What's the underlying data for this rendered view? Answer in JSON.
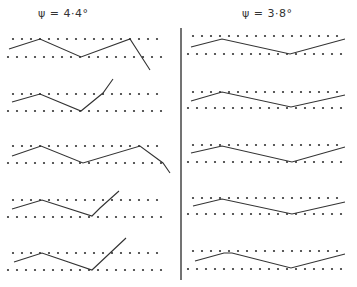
{
  "panels": [
    {
      "title": "ψ = 4·4°",
      "title_x": 60,
      "dot_x_start": 10,
      "dot_x_end": 162,
      "dot_spacing": 9,
      "rows": [
        {
          "top": 39,
          "bottom": 57,
          "points": [
            [
              9,
              49
            ],
            [
              40,
              39
            ],
            [
              81,
              57
            ],
            [
              130,
              39
            ],
            [
              150,
              70
            ]
          ]
        },
        {
          "top": 94,
          "bottom": 111,
          "points": [
            [
              12,
              102
            ],
            [
              40,
              94
            ],
            [
              81,
              111
            ],
            [
              103,
              93
            ],
            [
              113,
              79
            ]
          ]
        },
        {
          "top": 146,
          "bottom": 163,
          "points": [
            [
              12,
              156
            ],
            [
              41,
              146
            ],
            [
              83,
              163
            ],
            [
              140,
              146
            ],
            [
              163,
              163
            ],
            [
              170,
              173
            ]
          ]
        },
        {
          "top": 200,
          "bottom": 217,
          "points": [
            [
              12,
              209
            ],
            [
              42,
              200
            ],
            [
              92,
              216
            ],
            [
              100,
              208
            ],
            [
              119,
              191
            ]
          ]
        },
        {
          "top": 253,
          "bottom": 270,
          "points": [
            [
              14,
              262
            ],
            [
              42,
              253
            ],
            [
              92,
              270
            ],
            [
              126,
              238
            ]
          ]
        }
      ]
    },
    {
      "title": "ψ = 3·8°",
      "title_x": 265,
      "dot_x_start": 190,
      "dot_x_end": 344,
      "dot_spacing": 9,
      "rows": [
        {
          "top": 36,
          "bottom": 54,
          "points": [
            [
              191,
              47
            ],
            [
              222,
              39
            ],
            [
              290,
              54
            ],
            [
              345,
              39
            ]
          ]
        },
        {
          "top": 92,
          "bottom": 108,
          "points": [
            [
              191,
              101
            ],
            [
              222,
              92
            ],
            [
              291,
              107
            ],
            [
              345,
              95
            ]
          ]
        },
        {
          "top": 145,
          "bottom": 162,
          "points": [
            [
              191,
              153
            ],
            [
              222,
              146
            ],
            [
              292,
              162
            ],
            [
              345,
              147
            ]
          ]
        },
        {
          "top": 198,
          "bottom": 214,
          "points": [
            [
              193,
              206
            ],
            [
              222,
              199
            ],
            [
              292,
              214
            ],
            [
              345,
              202
            ]
          ]
        },
        {
          "top": 251,
          "bottom": 269,
          "points": [
            [
              195,
              261
            ],
            [
              224,
              253
            ],
            [
              232,
              253
            ],
            [
              291,
              268
            ],
            [
              345,
              254
            ]
          ]
        }
      ]
    }
  ],
  "divider": {
    "x": 181,
    "y1": 28,
    "y2": 280
  },
  "caption": "A.I.M. 153/11"
}
